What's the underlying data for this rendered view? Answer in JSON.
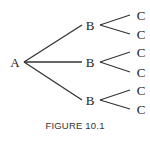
{
  "diagram": {
    "type": "tree",
    "root": {
      "label": "A",
      "x": 15,
      "y": 62
    },
    "level1": [
      {
        "label": "B",
        "x": 89,
        "y": 25
      },
      {
        "label": "B",
        "x": 89,
        "y": 62
      },
      {
        "label": "B",
        "x": 89,
        "y": 100
      }
    ],
    "level2": [
      {
        "label": "C",
        "x": 141,
        "y": 15
      },
      {
        "label": "C",
        "x": 141,
        "y": 34
      },
      {
        "label": "C",
        "x": 141,
        "y": 52
      },
      {
        "label": "C",
        "x": 141,
        "y": 72
      },
      {
        "label": "C",
        "x": 141,
        "y": 90
      },
      {
        "label": "C",
        "x": 141,
        "y": 109
      }
    ]
  },
  "caption": "FIGURE 10.1"
}
